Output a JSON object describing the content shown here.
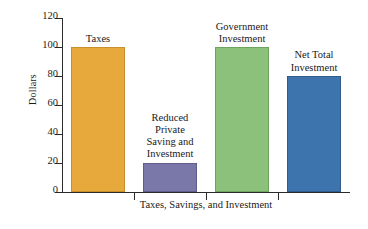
{
  "chart_data": {
    "type": "bar",
    "title": "",
    "xlabel": "Taxes, Savings, and Investment",
    "ylabel": "Dollars",
    "ylim": [
      0,
      120
    ],
    "yticks": [
      0,
      20,
      40,
      60,
      80,
      100,
      120
    ],
    "grid": false,
    "legend": "none",
    "categories": [
      "Taxes",
      "Reduced Private Saving and Investment",
      "Government Investment",
      "Net Total Investment"
    ],
    "category_label_lines": [
      [
        "Taxes"
      ],
      [
        "Reduced",
        "Private",
        "Saving and",
        "Investment"
      ],
      [
        "Government",
        "Investment"
      ],
      [
        "Net Total",
        "Investment"
      ]
    ],
    "values": [
      100,
      20,
      100,
      80
    ],
    "colors": [
      "#e8a93c",
      "#7a78a8",
      "#8cc17c",
      "#3d74ae"
    ],
    "bar_edge_colors": [
      "#c98f2b",
      "#5f5d8c",
      "#6ea45f",
      "#2f5c8c"
    ]
  }
}
